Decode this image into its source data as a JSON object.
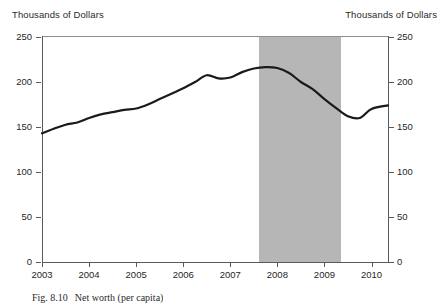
{
  "figure": {
    "left_axis_title": "Thousands of Dollars",
    "right_axis_title": "Thousands of Dollars",
    "caption_number": "Fig. 8.10",
    "caption_text": "Net worth (per capita)"
  },
  "chart_data": {
    "type": "line",
    "title": "",
    "subtitle": "",
    "xlabel": "",
    "ylabel": "Thousands of Dollars",
    "y2label": "Thousands of Dollars",
    "xlim": [
      2003,
      2010.35
    ],
    "ylim": [
      0,
      250
    ],
    "yticks": [
      0,
      50,
      100,
      150,
      200,
      250
    ],
    "xticks": [
      2003,
      2004,
      2005,
      2006,
      2007,
      2008,
      2009,
      2010
    ],
    "xtick_labels": [
      "2003",
      "2004",
      "2005",
      "2006",
      "2007",
      "2008",
      "2009",
      "2010"
    ],
    "ytick_labels": [
      "0",
      "50",
      "100",
      "150",
      "200",
      "250"
    ],
    "grid": false,
    "legend": null,
    "line_color": "#1a1a1a",
    "line_width": 2.2,
    "shaded_region": {
      "label": "recession",
      "color": "#b6b6b6",
      "x_start": 2007.6,
      "x_end": 2009.35
    },
    "series": [
      {
        "name": "Net worth per capita",
        "x": [
          2003.0,
          2003.25,
          2003.5,
          2003.75,
          2004.0,
          2004.25,
          2004.5,
          2004.75,
          2005.0,
          2005.25,
          2005.5,
          2005.75,
          2006.0,
          2006.25,
          2006.5,
          2006.75,
          2007.0,
          2007.25,
          2007.5,
          2007.75,
          2008.0,
          2008.25,
          2008.5,
          2008.75,
          2009.0,
          2009.25,
          2009.5,
          2009.75,
          2010.0,
          2010.35
        ],
        "values": [
          143.0,
          148.0,
          152.5,
          155.0,
          160.0,
          164.0,
          166.5,
          169.0,
          170.5,
          175.0,
          181.0,
          187.0,
          193.0,
          200.0,
          207.5,
          204.0,
          205.0,
          211.0,
          215.0,
          216.5,
          215.5,
          210.0,
          200.0,
          192.0,
          181.0,
          171.0,
          162.0,
          160.0,
          170.0,
          174.0
        ]
      }
    ]
  }
}
